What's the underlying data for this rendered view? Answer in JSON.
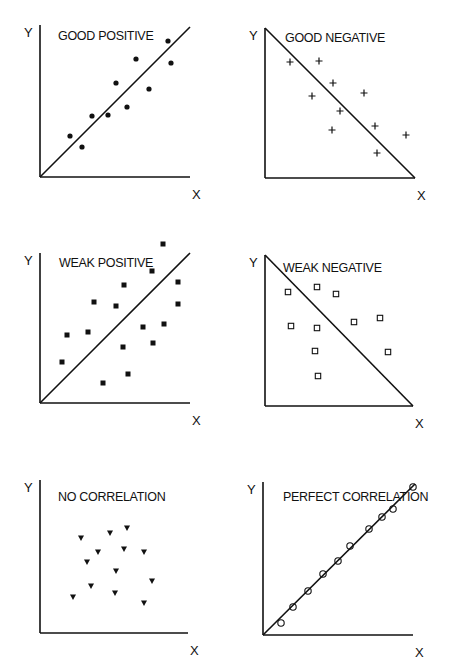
{
  "figure": {
    "width": 450,
    "height": 670,
    "line_color": "#111111",
    "background": "#ffffff"
  },
  "chart_data": [
    {
      "type": "scatter",
      "title": "GOOD POSITIVE",
      "xlabel": "X",
      "ylabel": "Y",
      "marker": "filled-circle",
      "axes": {
        "origin": [
          40,
          177
        ],
        "x_end": 190,
        "y_end": 25
      },
      "trend_line": {
        "from": [
          40,
          177
        ],
        "to": [
          190,
          27
        ]
      },
      "title_pos": [
        58,
        40
      ],
      "points_px": [
        [
          70,
          136
        ],
        [
          82,
          147
        ],
        [
          92,
          116
        ],
        [
          108,
          115
        ],
        [
          116,
          83
        ],
        [
          127,
          107
        ],
        [
          136,
          59
        ],
        [
          149,
          89
        ],
        [
          168,
          41
        ],
        [
          171,
          63
        ]
      ],
      "points_norm": [
        [
          0.2,
          0.27
        ],
        [
          0.28,
          0.2
        ],
        [
          0.35,
          0.41
        ],
        [
          0.45,
          0.41
        ],
        [
          0.51,
          0.63
        ],
        [
          0.58,
          0.47
        ],
        [
          0.64,
          0.79
        ],
        [
          0.73,
          0.59
        ],
        [
          0.85,
          0.91
        ],
        [
          0.87,
          0.76
        ]
      ]
    },
    {
      "type": "scatter",
      "title": "GOOD NEGATIVE",
      "xlabel": "X",
      "ylabel": "Y",
      "marker": "plus",
      "axes": {
        "origin": [
          265,
          178
        ],
        "x_end": 415,
        "y_end": 28
      },
      "trend_line": {
        "from": [
          265,
          28
        ],
        "to": [
          415,
          178
        ]
      },
      "title_pos": [
        285,
        42
      ],
      "points_px": [
        [
          290,
          62
        ],
        [
          319,
          61
        ],
        [
          333,
          83
        ],
        [
          312,
          96
        ],
        [
          364,
          93
        ],
        [
          340,
          111
        ],
        [
          332,
          130
        ],
        [
          375,
          126
        ],
        [
          406,
          135
        ],
        [
          377,
          153
        ]
      ],
      "points_norm": [
        [
          0.17,
          0.77
        ],
        [
          0.36,
          0.78
        ],
        [
          0.45,
          0.63
        ],
        [
          0.31,
          0.55
        ],
        [
          0.66,
          0.57
        ],
        [
          0.5,
          0.45
        ],
        [
          0.45,
          0.32
        ],
        [
          0.73,
          0.35
        ],
        [
          0.94,
          0.29
        ],
        [
          0.75,
          0.17
        ]
      ]
    },
    {
      "type": "scatter",
      "title": "WEAK POSITIVE",
      "xlabel": "X",
      "ylabel": "Y",
      "marker": "filled-square",
      "axes": {
        "origin": [
          40,
          403
        ],
        "x_end": 190,
        "y_end": 253
      },
      "trend_line": {
        "from": [
          40,
          403
        ],
        "to": [
          190,
          253
        ]
      },
      "title_pos": [
        59,
        267
      ],
      "points_px": [
        [
          163,
          244
        ],
        [
          152,
          271
        ],
        [
          178,
          282
        ],
        [
          124,
          285
        ],
        [
          94,
          302
        ],
        [
          116,
          306
        ],
        [
          178,
          304
        ],
        [
          67,
          335
        ],
        [
          88,
          332
        ],
        [
          143,
          327
        ],
        [
          164,
          324
        ],
        [
          153,
          343
        ],
        [
          123,
          347
        ],
        [
          62,
          362
        ],
        [
          128,
          374
        ],
        [
          103,
          383
        ]
      ],
      "points_norm": [
        [
          0.82,
          1.06
        ],
        [
          0.75,
          0.88
        ],
        [
          0.92,
          0.81
        ],
        [
          0.56,
          0.79
        ],
        [
          0.36,
          0.67
        ],
        [
          0.51,
          0.65
        ],
        [
          0.92,
          0.66
        ],
        [
          0.18,
          0.45
        ],
        [
          0.32,
          0.47
        ],
        [
          0.69,
          0.51
        ],
        [
          0.83,
          0.53
        ],
        [
          0.75,
          0.4
        ],
        [
          0.55,
          0.37
        ],
        [
          0.15,
          0.27
        ],
        [
          0.59,
          0.19
        ],
        [
          0.42,
          0.13
        ]
      ]
    },
    {
      "type": "scatter",
      "title": "WEAK NEGATIVE",
      "xlabel": "X",
      "ylabel": "Y",
      "marker": "open-square",
      "axes": {
        "origin": [
          265,
          406
        ],
        "x_end": 413,
        "y_end": 255
      },
      "trend_line": {
        "from": [
          265,
          255
        ],
        "to": [
          413,
          406
        ]
      },
      "title_pos": [
        283,
        272
      ],
      "points_px": [
        [
          288,
          292
        ],
        [
          317,
          287
        ],
        [
          336,
          294
        ],
        [
          291,
          326
        ],
        [
          317,
          328
        ],
        [
          354,
          322
        ],
        [
          380,
          318
        ],
        [
          315,
          351
        ],
        [
          388,
          352
        ],
        [
          318,
          376
        ]
      ],
      "points_norm": [
        [
          0.16,
          0.75
        ],
        [
          0.35,
          0.79
        ],
        [
          0.48,
          0.74
        ],
        [
          0.18,
          0.53
        ],
        [
          0.35,
          0.52
        ],
        [
          0.6,
          0.56
        ],
        [
          0.78,
          0.58
        ],
        [
          0.34,
          0.36
        ],
        [
          0.83,
          0.36
        ],
        [
          0.36,
          0.2
        ]
      ]
    },
    {
      "type": "scatter",
      "title": "NO CORRELATION",
      "xlabel": "X",
      "ylabel": "Y",
      "marker": "filled-triangle-down",
      "axes": {
        "origin": [
          40,
          633
        ],
        "x_end": 188,
        "y_end": 480
      },
      "trend_line": null,
      "title_pos": [
        58,
        501
      ],
      "points_px": [
        [
          81,
          538
        ],
        [
          110,
          533
        ],
        [
          127,
          528
        ],
        [
          98,
          552
        ],
        [
          124,
          549
        ],
        [
          144,
          552
        ],
        [
          87,
          562
        ],
        [
          116,
          571
        ],
        [
          152,
          581
        ],
        [
          91,
          586
        ],
        [
          73,
          597
        ],
        [
          115,
          593
        ],
        [
          144,
          603
        ]
      ],
      "points_norm": [
        [
          0.28,
          0.63
        ],
        [
          0.47,
          0.65
        ],
        [
          0.59,
          0.69
        ],
        [
          0.39,
          0.53
        ],
        [
          0.57,
          0.55
        ],
        [
          0.7,
          0.53
        ],
        [
          0.32,
          0.46
        ],
        [
          0.51,
          0.41
        ],
        [
          0.76,
          0.34
        ],
        [
          0.34,
          0.31
        ],
        [
          0.22,
          0.24
        ],
        [
          0.51,
          0.26
        ],
        [
          0.7,
          0.2
        ]
      ]
    },
    {
      "type": "scatter",
      "title": "PERFECT CORRELATION",
      "xlabel": "X",
      "ylabel": "Y",
      "marker": "open-circle",
      "axes": {
        "origin": [
          263,
          635
        ],
        "x_end": 413,
        "y_end": 482
      },
      "trend_line": {
        "from": [
          263,
          635
        ],
        "to": [
          415,
          484
        ]
      },
      "title_pos": [
        283,
        501
      ],
      "points_px": [
        [
          281,
          623
        ],
        [
          293,
          607
        ],
        [
          308,
          591
        ],
        [
          323,
          574
        ],
        [
          338,
          561
        ],
        [
          350,
          546
        ],
        [
          369,
          529
        ],
        [
          382,
          517
        ],
        [
          393,
          509
        ],
        [
          413,
          487
        ]
      ],
      "points_norm": [
        [
          0.12,
          0.08
        ],
        [
          0.2,
          0.18
        ],
        [
          0.3,
          0.29
        ],
        [
          0.4,
          0.4
        ],
        [
          0.5,
          0.48
        ],
        [
          0.58,
          0.58
        ],
        [
          0.71,
          0.69
        ],
        [
          0.79,
          0.77
        ],
        [
          0.87,
          0.82
        ],
        [
          1.0,
          0.97
        ]
      ]
    }
  ]
}
